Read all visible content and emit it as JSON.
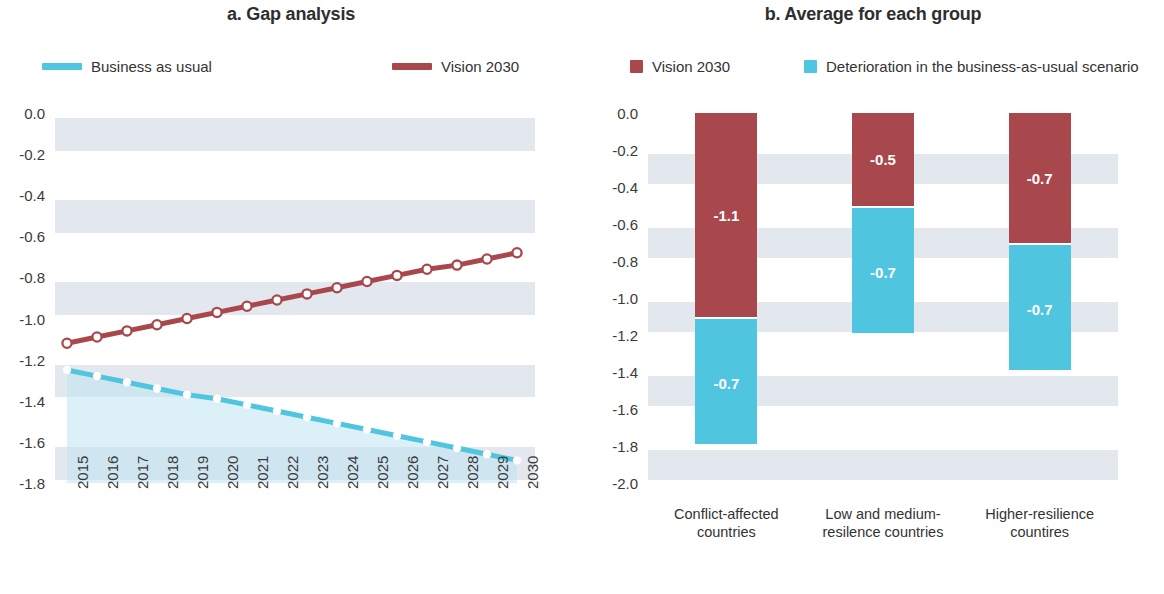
{
  "figure": {
    "background": "#ffffff",
    "band_color": "#d7dfe8",
    "band_tint_color": "#bfe3f2"
  },
  "colors": {
    "vision_2030": "#a8484c",
    "business_as_usual": "#4fc5e0",
    "deterioration": "#4fc5e0",
    "marker_fill": "#ffffff",
    "text": "#3a3a3a"
  },
  "panel_a": {
    "title": "a. Gap analysis",
    "legend": [
      {
        "label": "Business as usual",
        "color": "#4fc5e0",
        "marker": "line"
      },
      {
        "label": "Vision 2030",
        "color": "#a8484c",
        "marker": "line"
      }
    ]
  },
  "panel_b": {
    "title": "b. Average for each group",
    "legend": [
      {
        "label": "Vision 2030",
        "color": "#a8484c",
        "marker": "square"
      },
      {
        "label": "Deterioration in the business-as-usual scenario",
        "color": "#4fc5e0",
        "marker": "square"
      }
    ]
  },
  "chart_data": [
    {
      "type": "line",
      "panel": "a",
      "title": "a. Gap analysis",
      "xlabel": "",
      "ylabel": "",
      "x": [
        2015,
        2016,
        2017,
        2018,
        2019,
        2020,
        2021,
        2022,
        2023,
        2024,
        2025,
        2026,
        2027,
        2028,
        2029,
        2030
      ],
      "xticklabels": [
        "2015",
        "2016",
        "2017",
        "2018",
        "2019",
        "2020",
        "2021",
        "2022",
        "2023",
        "2024",
        "2025",
        "2026",
        "2027",
        "2028",
        "2029",
        "2030"
      ],
      "yticklabels": [
        "0.0",
        "-0.2",
        "-0.4",
        "-0.6",
        "-0.8",
        "-1.0",
        "-1.2",
        "-1.4",
        "-1.6",
        "-1.8"
      ],
      "yticks": [
        0.0,
        -0.2,
        -0.4,
        -0.6,
        -0.8,
        -1.0,
        -1.2,
        -1.4,
        -1.6,
        -1.8
      ],
      "ylim": [
        -1.8,
        0.0
      ],
      "grid": "horizontal-bands",
      "legend_position": "top",
      "series": [
        {
          "name": "Vision 2030",
          "color": "#a8484c",
          "marker": "open-circle",
          "values": [
            -1.12,
            -1.09,
            -1.06,
            -1.03,
            -1.0,
            -0.97,
            -0.94,
            -0.91,
            -0.88,
            -0.85,
            -0.82,
            -0.79,
            -0.76,
            -0.74,
            -0.71,
            -0.68
          ]
        },
        {
          "name": "Business as usual",
          "color": "#4fc5e0",
          "marker": "filled-circle",
          "values": [
            -1.25,
            -1.28,
            -1.31,
            -1.34,
            -1.37,
            -1.39,
            -1.42,
            -1.45,
            -1.48,
            -1.51,
            -1.54,
            -1.57,
            -1.6,
            -1.63,
            -1.66,
            -1.69
          ]
        }
      ]
    },
    {
      "type": "bar",
      "panel": "b",
      "subtype": "stacked",
      "title": "b. Average for each group",
      "xlabel": "",
      "ylabel": "",
      "categories": [
        "Conflict-affected countries",
        "Low and medium-resilence countries",
        "Higher-resilience countires"
      ],
      "category_lines": [
        [
          "Conflict-affected",
          "countries"
        ],
        [
          "Low and medium-",
          "resilence countries"
        ],
        [
          "Higher-resilience",
          "countires"
        ]
      ],
      "yticklabels": [
        "0.0",
        "-0.2",
        "-0.4",
        "-0.6",
        "-0.8",
        "-1.0",
        "-1.2",
        "-1.4",
        "-1.6",
        "-1.8",
        "-2.0"
      ],
      "yticks": [
        0.0,
        -0.2,
        -0.4,
        -0.6,
        -0.8,
        -1.0,
        -1.2,
        -1.4,
        -1.6,
        -1.8,
        -2.0
      ],
      "ylim": [
        -2.0,
        0.0
      ],
      "grid": "horizontal-bands",
      "legend_position": "top",
      "series": [
        {
          "name": "Vision 2030",
          "color": "#a8484c",
          "values": [
            -1.1,
            -0.5,
            -0.7
          ],
          "labels": [
            "-1.1",
            "-0.5",
            "-0.7"
          ]
        },
        {
          "name": "Deterioration in the business-as-usual scenario",
          "color": "#4fc5e0",
          "values": [
            -0.7,
            -0.7,
            -0.7
          ],
          "labels": [
            "-0.7",
            "-0.7",
            "-0.7"
          ]
        }
      ]
    }
  ]
}
